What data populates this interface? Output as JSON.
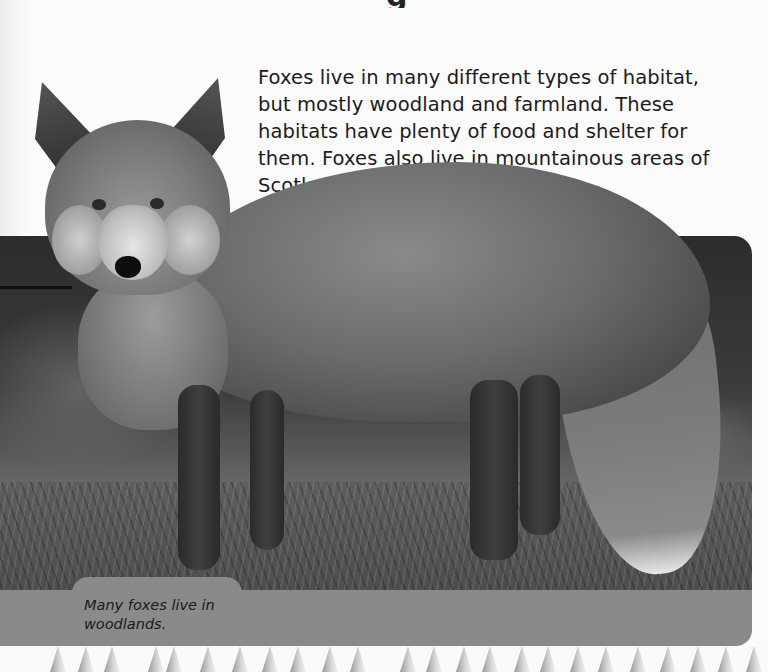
{
  "page": {
    "heading_fragment": "g",
    "intro_paragraph": "Foxes live in many different types of habitat, but mostly woodland and farmland. These habitats have plenty of food and shelter for them. Foxes also live in mountainous areas of Scotland and Wales.",
    "photo": {
      "subject": "Red fox standing on woodland floor",
      "style": "grayscale photograph"
    },
    "caption": "Many foxes live in woodlands.",
    "decoration": "grass-blade border"
  },
  "colors": {
    "page_background": "#fbfbfb",
    "text": "#1c1c1c",
    "caption_band": "#8a8a8a"
  }
}
